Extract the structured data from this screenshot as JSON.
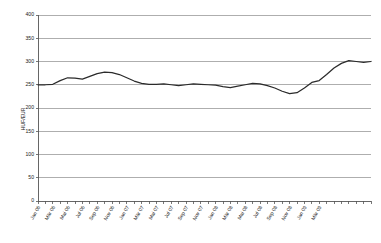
{
  "chart_data": {
    "type": "line",
    "title": "",
    "xlabel": "",
    "ylabel": "HUF/EUR",
    "ylim": [
      0,
      400
    ],
    "yticks": [
      0,
      50,
      100,
      150,
      200,
      250,
      300,
      350,
      400
    ],
    "grid": true,
    "legend": false,
    "legend_position": "none",
    "line_color": "#2b2b2b",
    "grid_color": "#9a9a9a",
    "axis_color": "#555555",
    "background_color": "#ffffff",
    "categories": [
      "Jan 06",
      "Feb 06",
      "Mär 06",
      "Apr 06",
      "Mai 06",
      "Jun 06",
      "Jul 06",
      "Aug 06",
      "Sep 06",
      "Okt 06",
      "Nov 06",
      "Dez 06",
      "Jan 07",
      "Feb 07",
      "Mär 07",
      "Apr 07",
      "Mai 07",
      "Jun 07",
      "Jul 07",
      "Aug 07",
      "Sep 07",
      "Okt 07",
      "Nov 07",
      "Dez 07",
      "Jan 08",
      "Feb 08",
      "Mär 08",
      "Apr 08",
      "Mai 08",
      "Jun 08",
      "Jul 08",
      "Aug 08",
      "Sep 08",
      "Okt 08",
      "Nov 08",
      "Dez 08",
      "Jan 09",
      "Feb 09",
      "Mär 09",
      "Apr 09"
    ],
    "xtick_labels": [
      "Jan 06",
      "Mär 06",
      "Mai 06",
      "Jul 06",
      "Sep 06",
      "Nov 06",
      "Jan 07",
      "Mär 07",
      "Mai 07",
      "Jul 07",
      "Sep 07",
      "Nov 07",
      "Jan 08",
      "Mär 08",
      "Mai 08",
      "Jul 08",
      "Sep 08",
      "Nov 08",
      "Jan 09",
      "Mär 09"
    ],
    "values": [
      250,
      250,
      251,
      259,
      265,
      264,
      262,
      268,
      274,
      277,
      276,
      272,
      265,
      258,
      253,
      251,
      251,
      252,
      250,
      248,
      250,
      252,
      251,
      250,
      249,
      246,
      244,
      247,
      250,
      253,
      252,
      248,
      243,
      236,
      231,
      233,
      243,
      255,
      259,
      272
    ],
    "series": [
      {
        "name": "HUF/EUR",
        "values": [
          250,
          250,
          251,
          259,
          265,
          264,
          262,
          268,
          274,
          277,
          276,
          272,
          265,
          258,
          253,
          251,
          251,
          252,
          250,
          248,
          250,
          252,
          251,
          250,
          249,
          246,
          244,
          247,
          250,
          253,
          252,
          248,
          243,
          236,
          231,
          233,
          243,
          255,
          259,
          272
        ]
      }
    ],
    "value_min": 231,
    "value_max": 302,
    "tail_values": [
      286,
      296,
      302,
      300,
      298,
      300
    ]
  }
}
